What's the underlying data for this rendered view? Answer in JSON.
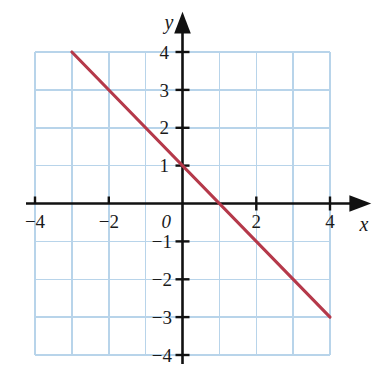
{
  "chart_data": {
    "type": "line",
    "title": "",
    "subtitle": "",
    "xlabel": "x",
    "ylabel": "y",
    "xlim": [
      -4,
      4
    ],
    "ylim": [
      -4,
      4
    ],
    "grid": true,
    "grid_step": 1,
    "legend": "none",
    "x_tick_labels": [
      "−4",
      "−2",
      "0",
      "2",
      "4"
    ],
    "x_tick_values": [
      -4,
      -2,
      0,
      2,
      4
    ],
    "y_tick_labels": [
      "4",
      "3",
      "2",
      "1",
      "−1",
      "−2",
      "−3",
      "−4"
    ],
    "y_tick_values": [
      4,
      3,
      2,
      1,
      -1,
      -2,
      -3,
      -4
    ],
    "x_minor_ticks": [
      -3,
      -1,
      1,
      3
    ],
    "series": [
      {
        "name": "y = -x + 1",
        "equation": "y = −x + 1",
        "slope": -1,
        "intercept": 1,
        "color": "#b5394a",
        "x": [
          -3,
          4
        ],
        "values": [
          4,
          -3
        ],
        "points": [
          [
            -3,
            4
          ],
          [
            4,
            -3
          ]
        ],
        "x_intercept": [
          1,
          0
        ],
        "y_intercept": [
          0,
          1
        ]
      }
    ],
    "axis_color": "#111111",
    "grid_color": "#b8d4ea",
    "background": "#ffffff"
  },
  "axes": {
    "x_axis_label": "x",
    "y_axis_label": "y",
    "origin_label": "0"
  },
  "ticks": {
    "x": [
      {
        "value": -4,
        "label": "−4"
      },
      {
        "value": -2,
        "label": "−2"
      },
      {
        "value": 2,
        "label": "2"
      },
      {
        "value": 4,
        "label": "4"
      }
    ],
    "y": [
      {
        "value": 4,
        "label": "4"
      },
      {
        "value": 3,
        "label": "3"
      },
      {
        "value": 2,
        "label": "2"
      },
      {
        "value": 1,
        "label": "1"
      },
      {
        "value": -1,
        "label": "−1"
      },
      {
        "value": -2,
        "label": "−2"
      },
      {
        "value": -3,
        "label": "−3"
      },
      {
        "value": -4,
        "label": "−4"
      }
    ]
  }
}
